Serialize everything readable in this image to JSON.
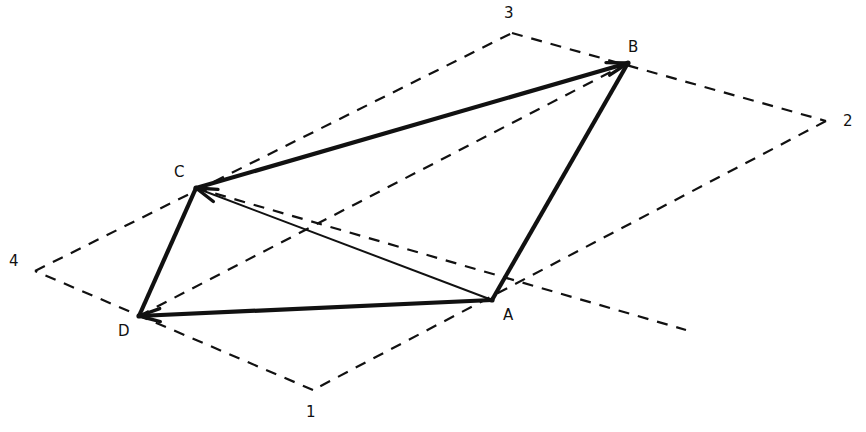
{
  "figure": {
    "width": 866,
    "height": 432,
    "background_color": "#ffffff",
    "stroke_color": "#111111"
  },
  "style": {
    "thick_width": 4.2,
    "medium_width": 2.6,
    "thin_width": 2.0,
    "dashed_width": 2.2,
    "dash_pattern": "11 9"
  },
  "parallelogram": {
    "name": "outer-dashed-parallelogram",
    "line_style": "dashed",
    "corners": [
      {
        "label": "1",
        "x": 313,
        "y": 390,
        "label_x": 306,
        "label_y": 405
      },
      {
        "label": "2",
        "x": 826,
        "y": 121,
        "label_x": 843,
        "label_y": 114
      },
      {
        "label": "3",
        "x": 512,
        "y": 33,
        "label_x": 504,
        "label_y": 6
      },
      {
        "label": "4",
        "x": 35,
        "y": 271,
        "label_x": 9,
        "label_y": 254
      }
    ],
    "edges": [
      {
        "name": "edge-4-3",
        "from": [
          35,
          271
        ],
        "to": [
          512,
          33
        ]
      },
      {
        "name": "edge-3-2",
        "from": [
          512,
          33
        ],
        "to": [
          826,
          121
        ]
      },
      {
        "name": "edge-2-1",
        "from": [
          826,
          121
        ],
        "to": [
          313,
          390
        ]
      },
      {
        "name": "edge-1-4",
        "from": [
          313,
          390
        ],
        "to": [
          35,
          271
        ]
      }
    ],
    "diagonals": [
      {
        "name": "diagonal-d-b",
        "from": [
          139,
          316
        ],
        "to": [
          628,
          63
        ]
      },
      {
        "name": "diagonal-c-a-extended",
        "from": [
          196,
          188
        ],
        "to": [
          686,
          330
        ]
      }
    ]
  },
  "quadrilateral": {
    "name": "inner-solid-quadrilateral",
    "line_style": "solid",
    "vertices": [
      {
        "label": "A",
        "x": 492,
        "y": 300,
        "label_x": 503,
        "label_y": 308
      },
      {
        "label": "B",
        "x": 628,
        "y": 63,
        "label_x": 628,
        "label_y": 40
      },
      {
        "label": "C",
        "x": 196,
        "y": 188,
        "label_x": 174,
        "label_y": 165
      },
      {
        "label": "D",
        "x": 139,
        "y": 316,
        "label_x": 118,
        "label_y": 324
      }
    ],
    "edges": [
      {
        "name": "edge-c-b",
        "from": [
          196,
          188
        ],
        "to": [
          628,
          63
        ],
        "weight": "thick",
        "arrow_at_end": true
      },
      {
        "name": "edge-b-a",
        "from": [
          628,
          63
        ],
        "to": [
          492,
          300
        ],
        "weight": "thick",
        "arrow_at_end": false
      },
      {
        "name": "edge-a-d",
        "from": [
          492,
          300
        ],
        "to": [
          139,
          316
        ],
        "weight": "thick",
        "arrow_at_end": true
      },
      {
        "name": "edge-d-c",
        "from": [
          139,
          316
        ],
        "to": [
          196,
          188
        ],
        "weight": "thick",
        "arrow_at_end": false
      }
    ],
    "diagonals": [
      {
        "name": "diagonal-a-c",
        "from": [
          492,
          300
        ],
        "to": [
          196,
          188
        ],
        "weight": "thin",
        "arrow_at_end": true
      }
    ]
  }
}
